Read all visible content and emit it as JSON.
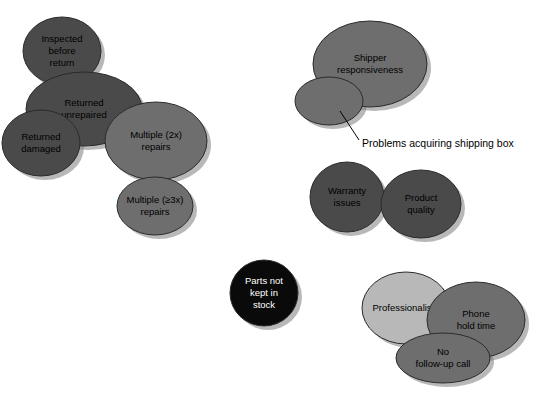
{
  "diagram": {
    "type": "venn-cluster",
    "background_color": "#FFFFFF",
    "outline_color": "#2B2B2B",
    "shadow_color": "#7D7D7D",
    "palette": {
      "dark_gray": "#4A4A4A",
      "mid_gray": "#6E6E6E",
      "light_gray": "#B8B8B8",
      "black": "#0A0A0A",
      "text_dark": "#000000",
      "text_light": "#FFFFFF"
    },
    "clusters": [
      {
        "name": "returns-cluster",
        "shapes": [
          {
            "id": "inspected-before-return",
            "label": "Inspected\nbefore\nreturn",
            "label_lines": [
              "Inspected",
              "before",
              "return"
            ],
            "cx": 62,
            "cy": 51,
            "rx": 39,
            "ry": 34,
            "fill": "#4A4A4A",
            "text_color": "#000000"
          },
          {
            "id": "returned-unrepaired",
            "label": "Returned\nunrepaired",
            "label_lines": [
              "Returned",
              "unrepaired"
            ],
            "cx": 84,
            "cy": 109,
            "rx": 58,
            "ry": 37,
            "fill": "#4A4A4A",
            "text_color": "#000000"
          },
          {
            "id": "returned-damaged",
            "label": "Returned\ndamaged",
            "label_lines": [
              "Returned",
              "damaged"
            ],
            "cx": 41,
            "cy": 143,
            "rx": 39,
            "ry": 33,
            "fill": "#4A4A4A",
            "text_color": "#000000"
          },
          {
            "id": "multiple-2x-repairs",
            "label": "Multiple (2x)\nrepairs",
            "label_lines": [
              "Multiple (2x)",
              "repairs"
            ],
            "cx": 156,
            "cy": 141,
            "rx": 51,
            "ry": 39,
            "fill": "#6E6E6E",
            "text_color": "#000000"
          },
          {
            "id": "multiple-3x-repairs",
            "label": "Multiple (≥3x)\nrepairs",
            "label_lines": [
              "Multiple (≥3x)",
              "repairs"
            ],
            "cx": 155,
            "cy": 206,
            "rx": 38,
            "ry": 29,
            "fill": "#6E6E6E",
            "text_color": "#000000"
          }
        ]
      },
      {
        "name": "shipping-cluster",
        "shapes": [
          {
            "id": "shipper-responsiveness",
            "label": "Shipper\nresponsiveness",
            "label_lines": [
              "Shipper",
              "responsiveness"
            ],
            "cx": 370,
            "cy": 64,
            "rx": 57,
            "ry": 43,
            "fill": "#6E6E6E",
            "text_color": "#000000"
          },
          {
            "id": "problems-acquiring-shipping-box",
            "label": "",
            "label_lines": [],
            "cx": 329,
            "cy": 101,
            "rx": 34,
            "ry": 24,
            "fill": "#6E6E6E",
            "text_color": "#000000"
          }
        ],
        "callout": {
          "id": "problems-acquiring-shipping-box-callout",
          "text": "Problems acquiring shipping box",
          "text_x": 362,
          "text_y": 144,
          "line_from_x": 340,
          "line_from_y": 111,
          "line_to_x": 359,
          "line_to_y": 140
        }
      },
      {
        "name": "quality-cluster",
        "shapes": [
          {
            "id": "warranty-issues",
            "label": "Warranty\nissues",
            "label_lines": [
              "Warranty",
              "issues"
            ],
            "cx": 347,
            "cy": 197,
            "rx": 37,
            "ry": 35,
            "fill": "#4A4A4A",
            "text_color": "#000000"
          },
          {
            "id": "product-quality",
            "label": "Product\nquality",
            "label_lines": [
              "Product",
              "quality"
            ],
            "cx": 421,
            "cy": 204,
            "rx": 40,
            "ry": 34,
            "fill": "#4A4A4A",
            "text_color": "#000000"
          }
        ]
      },
      {
        "name": "parts-cluster",
        "shapes": [
          {
            "id": "parts-not-kept-in-stock",
            "label": "Parts not\nkept in\nstock",
            "label_lines": [
              "Parts not",
              "kept in",
              "stock"
            ],
            "cx": 264,
            "cy": 293,
            "rx": 34,
            "ry": 33,
            "fill": "#0A0A0A",
            "text_color": "#FFFFFF"
          }
        ]
      },
      {
        "name": "support-cluster",
        "shapes": [
          {
            "id": "professionalism",
            "label": "Professionalism",
            "label_lines": [
              "Professionalism"
            ],
            "cx": 406,
            "cy": 308,
            "rx": 44,
            "ry": 36,
            "fill": "#B8B8B8",
            "text_color": "#000000"
          },
          {
            "id": "phone-hold-time",
            "label": "Phone\nhold time",
            "label_lines": [
              "Phone",
              "hold time"
            ],
            "cx": 476,
            "cy": 320,
            "rx": 49,
            "ry": 38,
            "fill": "#6E6E6E",
            "text_color": "#000000"
          },
          {
            "id": "no-follow-up-call",
            "label": "No\nfollow-up call",
            "label_lines": [
              "No",
              "follow-up call"
            ],
            "cx": 443,
            "cy": 358,
            "rx": 47,
            "ry": 25,
            "fill": "#6E6E6E",
            "text_color": "#000000"
          }
        ]
      }
    ]
  }
}
